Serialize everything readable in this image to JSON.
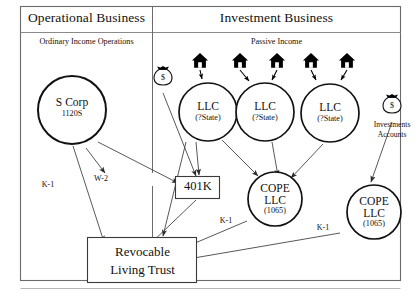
{
  "figure": {
    "outer_border_color": "#555555",
    "line_color": "#3a3a3a",
    "icon_color": "#000000",
    "text_color": "#111111"
  },
  "columns": [
    {
      "id": "operational",
      "title": "Operational Business",
      "subtitle": "Ordinary Income Operations"
    },
    {
      "id": "investment",
      "title": "Investment Business",
      "subtitle": "Passive Income"
    }
  ],
  "nodes": {
    "s_corp": {
      "name": "S Corp",
      "form": "1120S",
      "shape": "circle"
    },
    "llc_1": {
      "name": "LLC",
      "form": "(?State)",
      "shape": "circle"
    },
    "llc_2": {
      "name": "LLC",
      "form": "(?State)",
      "shape": "circle"
    },
    "llc_3": {
      "name": "LLC",
      "form": "(?State)",
      "shape": "circle"
    },
    "cope_1": {
      "name": "COPE",
      "name2": "LLC",
      "form": "(1065)",
      "shape": "circle"
    },
    "cope_2": {
      "name": "COPE",
      "name2": "LLC",
      "form": "(1065)",
      "shape": "circle"
    },
    "k401": {
      "name": "401K",
      "shape": "rect"
    },
    "trust": {
      "line1": "Revocable",
      "line2": "Living Trust",
      "shape": "rect"
    }
  },
  "icons": {
    "money_bag_left": {
      "glyph": "money-bag",
      "symbol": "$"
    },
    "money_bag_right": {
      "glyph": "money-bag",
      "symbol": "$",
      "label_line1": "Investments",
      "label_line2": "Accounts"
    },
    "houses": [
      {
        "glyph": "house"
      },
      {
        "glyph": "house"
      },
      {
        "glyph": "house"
      },
      {
        "glyph": "house"
      },
      {
        "glyph": "house"
      }
    ]
  },
  "edge_labels": {
    "w2": "W-2",
    "k1_scorp_trust": "K-1",
    "k1_cope1_trust": "K-1",
    "k1_cope2_trust": "K-1"
  }
}
